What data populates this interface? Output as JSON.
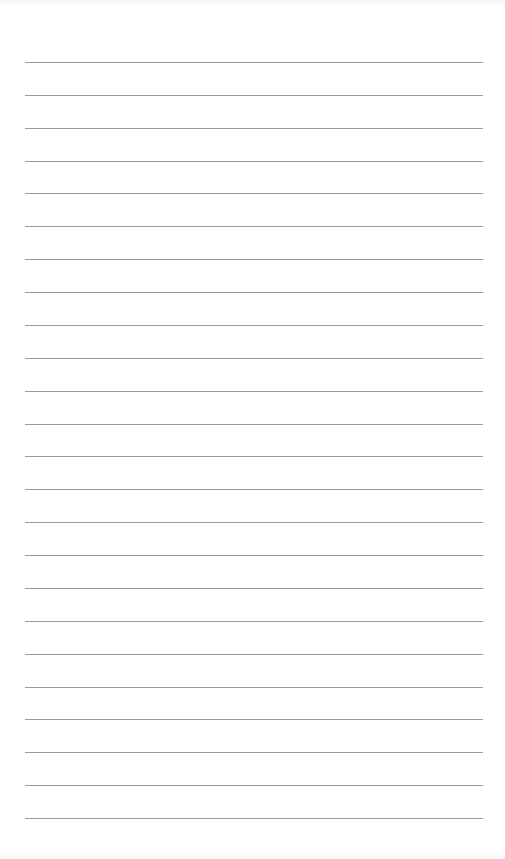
{
  "page": {
    "type": "lined-paper",
    "background_color": "#ffffff",
    "rule_color": "#9c9c9c",
    "rule_count": 24,
    "rule_left": 25,
    "rule_right": 483,
    "first_rule_y": 62,
    "last_rule_y": 818,
    "text": ""
  }
}
